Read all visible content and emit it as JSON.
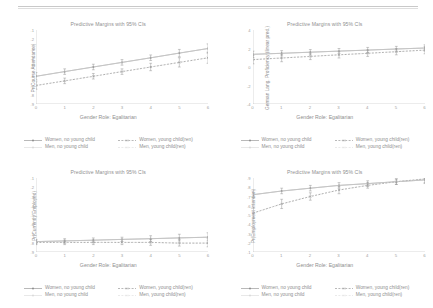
{
  "document": {
    "background": "#ffffff",
    "ink": "#8f8f8f",
    "rule_color": "#c9c9c9"
  },
  "legend": {
    "items": [
      {
        "label": "Women, no young child",
        "style": "solid-circle"
      },
      {
        "label": "Women, young child(ren)",
        "style": "dashed-x"
      },
      {
        "label": "Men, no young child",
        "style": "solid-light"
      },
      {
        "label": "Men, young child(ren)",
        "style": "dotted-light"
      }
    ]
  },
  "shared": {
    "title": "Predictive Margins with 95% CIs",
    "xlabel": "Gender Role: Egalitarian",
    "xticks": [
      "0",
      "1",
      "2",
      "3",
      "4",
      "5",
      "6"
    ]
  },
  "chart_data": [
    {
      "type": "line",
      "panel": "top-left",
      "title": "Predictive Margins with 95% CIs",
      "xlabel": "Gender Role: Egalitarian",
      "ylabel": "Pr(Course Attendance)",
      "x": [
        0,
        1,
        2,
        3,
        4,
        5,
        6
      ],
      "xlim": [
        0,
        6
      ],
      "ylim": [
        0.1,
        0.9
      ],
      "yticks": [
        ".1",
        ".2",
        ".3",
        ".4",
        ".5",
        ".6",
        ".7",
        ".8",
        ".9"
      ],
      "grid": false,
      "legend_position": "bottom",
      "series": [
        {
          "name": "Women, no young child",
          "values": [
            0.4,
            0.45,
            0.5,
            0.55,
            0.6,
            0.65,
            0.7
          ],
          "ci_low": [
            0.36,
            0.42,
            0.47,
            0.52,
            0.57,
            0.61,
            0.65
          ],
          "ci_high": [
            0.44,
            0.48,
            0.53,
            0.58,
            0.63,
            0.69,
            0.75
          ]
        },
        {
          "name": "Women, young child(ren)",
          "values": [
            0.3,
            0.35,
            0.4,
            0.45,
            0.5,
            0.55,
            0.6
          ],
          "ci_low": [
            0.26,
            0.32,
            0.37,
            0.42,
            0.46,
            0.5,
            0.54
          ],
          "ci_high": [
            0.34,
            0.38,
            0.43,
            0.48,
            0.54,
            0.6,
            0.66
          ]
        },
        {
          "name": "Men, no young child",
          "values": [
            0.4,
            0.45,
            0.5,
            0.55,
            0.6,
            0.65,
            0.7
          ]
        },
        {
          "name": "Men, young child(ren)",
          "values": [
            0.3,
            0.35,
            0.4,
            0.45,
            0.5,
            0.55,
            0.6
          ]
        }
      ]
    },
    {
      "type": "line",
      "panel": "top-right",
      "title": "Predictive Margins with 95% CIs",
      "xlabel": "Gender Role: Egalitarian",
      "ylabel": "German Lang. Proficiency (linear pred.)",
      "x": [
        0,
        1,
        2,
        3,
        4,
        5,
        6
      ],
      "xlim": [
        0,
        6
      ],
      "ylim": [
        -10,
        4
      ],
      "yticks": [
        "4",
        "2",
        "0",
        "-2",
        "-4"
      ],
      "grid": false,
      "legend_position": "bottom",
      "series": [
        {
          "name": "Women, no young child",
          "values": [
            -0.6,
            -0.4,
            -0.2,
            0.0,
            0.2,
            0.4,
            0.6
          ],
          "ci_low": [
            -1.2,
            -0.9,
            -0.7,
            -0.5,
            -0.3,
            -0.1,
            0.0
          ],
          "ci_high": [
            0.0,
            0.1,
            0.3,
            0.5,
            0.7,
            0.9,
            1.2
          ]
        },
        {
          "name": "Women, young child(ren)",
          "values": [
            -1.6,
            -1.3,
            -1.0,
            -0.7,
            -0.4,
            -0.1,
            0.2
          ],
          "ci_low": [
            -2.4,
            -2.0,
            -1.6,
            -1.3,
            -1.0,
            -0.7,
            -0.5
          ],
          "ci_high": [
            -0.8,
            -0.6,
            -0.4,
            -0.1,
            0.2,
            0.5,
            0.9
          ]
        },
        {
          "name": "Men, no young child",
          "values": [
            -0.6,
            -0.4,
            -0.2,
            0.0,
            0.2,
            0.4,
            0.6
          ]
        },
        {
          "name": "Men, young child(ren)",
          "values": [
            -1.6,
            -1.3,
            -1.0,
            -0.7,
            -0.4,
            -0.1,
            0.2
          ]
        }
      ]
    },
    {
      "type": "line",
      "panel": "bottom-left",
      "title": "Predictive Margins with 95% CIs",
      "xlabel": "Gender Role: Egalitarian",
      "ylabel": "Pr(Currently Employed)",
      "x": [
        0,
        1,
        2,
        3,
        4,
        5,
        6
      ],
      "xlim": [
        0,
        6
      ],
      "ylim": [
        0,
        1
      ],
      "yticks": [
        ".1",
        ".2",
        ".3",
        ".4",
        ".5",
        ".6",
        ".7",
        ".8",
        ".9"
      ],
      "grid": false,
      "legend_position": "bottom",
      "series": [
        {
          "name": "Women, no young child",
          "values": [
            0.14,
            0.15,
            0.16,
            0.17,
            0.18,
            0.19,
            0.2
          ],
          "ci_low": [
            0.11,
            0.12,
            0.13,
            0.14,
            0.14,
            0.15,
            0.15
          ],
          "ci_high": [
            0.17,
            0.18,
            0.19,
            0.2,
            0.22,
            0.24,
            0.26
          ]
        },
        {
          "name": "Women, young child(ren)",
          "values": [
            0.13,
            0.13,
            0.13,
            0.13,
            0.13,
            0.12,
            0.12
          ],
          "ci_low": [
            0.1,
            0.1,
            0.1,
            0.1,
            0.09,
            0.08,
            0.07
          ],
          "ci_high": [
            0.16,
            0.16,
            0.16,
            0.17,
            0.17,
            0.17,
            0.18
          ]
        },
        {
          "name": "Men, no young child",
          "values": [
            0.14,
            0.15,
            0.16,
            0.17,
            0.18,
            0.19,
            0.2
          ]
        },
        {
          "name": "Men, young child(ren)",
          "values": [
            0.13,
            0.13,
            0.13,
            0.13,
            0.13,
            0.12,
            0.12
          ]
        }
      ]
    },
    {
      "type": "line",
      "panel": "bottom-right",
      "title": "Predictive Margins with 95% CIs",
      "xlabel": "Gender Role: Egalitarian",
      "ylabel": "Pr(Employment Intention)",
      "x": [
        0,
        1,
        2,
        3,
        4,
        5,
        6
      ],
      "xlim": [
        0,
        6
      ],
      "ylim": [
        0.1,
        0.9
      ],
      "yticks": [
        ".9",
        ".8",
        ".7",
        ".6",
        ".5",
        ".4",
        ".3",
        ".2",
        ".1"
      ],
      "grid": false,
      "legend_position": "bottom",
      "series": [
        {
          "name": "Women, no young child",
          "values": [
            0.72,
            0.76,
            0.79,
            0.82,
            0.84,
            0.86,
            0.88
          ],
          "ci_low": [
            0.68,
            0.73,
            0.76,
            0.79,
            0.81,
            0.83,
            0.84
          ],
          "ci_high": [
            0.76,
            0.79,
            0.82,
            0.85,
            0.87,
            0.89,
            0.92
          ]
        },
        {
          "name": "Women, young child(ren)",
          "values": [
            0.52,
            0.62,
            0.7,
            0.77,
            0.82,
            0.86,
            0.89
          ],
          "ci_low": [
            0.46,
            0.57,
            0.66,
            0.73,
            0.79,
            0.83,
            0.85
          ],
          "ci_high": [
            0.58,
            0.67,
            0.74,
            0.81,
            0.85,
            0.89,
            0.93
          ]
        },
        {
          "name": "Men, no young child",
          "values": [
            0.72,
            0.76,
            0.79,
            0.82,
            0.84,
            0.86,
            0.88
          ]
        },
        {
          "name": "Men, young child(ren)",
          "values": [
            0.52,
            0.62,
            0.7,
            0.77,
            0.82,
            0.86,
            0.89
          ]
        }
      ]
    }
  ]
}
